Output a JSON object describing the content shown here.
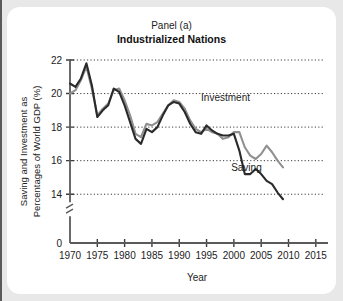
{
  "figure": {
    "panel_label": "Panel (a)",
    "title": "Industrialized Nations",
    "background_color": "#e8e8e8",
    "card_color": "#ffffff"
  },
  "chart_data": {
    "type": "line",
    "title": "Industrialized Nations",
    "subtitle": "Panel (a)",
    "xlabel": "Year",
    "ylabel": "Saving and Investment as Percentages of World GDP (%)",
    "ylabel_line1": "Saving and Investment as",
    "ylabel_line2": "Percentages of World GDP (%)",
    "xlim": [
      1970,
      2016.5
    ],
    "ylim": [
      13.0,
      22.0
    ],
    "yticks": [
      14,
      16,
      18,
      20,
      22
    ],
    "ytick_labels": [
      "14",
      "16",
      "18",
      "20",
      "22"
    ],
    "y_axis_origin_label": "0",
    "y_axis_break": true,
    "xticks": [
      1970,
      1975,
      1980,
      1985,
      1990,
      1995,
      2000,
      2005,
      2010,
      2015
    ],
    "xtick_labels": [
      "1970",
      "1975",
      "1980",
      "1985",
      "1990",
      "1995",
      "2000",
      "2005",
      "2010",
      "2015"
    ],
    "grid": "horizontal-dotted",
    "legend_position": "inline-annotation",
    "series": [
      {
        "name": "Investment",
        "color": "#909090",
        "annotation_x": 1994.0,
        "annotation_y": 19.55,
        "x": [
          1970,
          1971,
          1972,
          1973,
          1974,
          1975,
          1976,
          1977,
          1978,
          1979,
          1980,
          1981,
          1982,
          1983,
          1984,
          1985,
          1986,
          1987,
          1988,
          1989,
          1990,
          1991,
          1992,
          1993,
          1994,
          1995,
          1996,
          1997,
          1998,
          1999,
          2000,
          2001,
          2002,
          2003,
          2004,
          2005,
          2006,
          2007,
          2008,
          2009
        ],
        "values": [
          20.0,
          20.2,
          20.8,
          21.6,
          20.3,
          18.7,
          19.1,
          19.4,
          20.2,
          20.3,
          19.6,
          18.7,
          17.6,
          17.4,
          18.2,
          18.1,
          18.3,
          18.8,
          19.3,
          19.6,
          19.5,
          19.1,
          18.4,
          17.9,
          17.7,
          17.9,
          17.7,
          17.6,
          17.3,
          17.4,
          17.7,
          17.7,
          16.8,
          16.3,
          16.1,
          16.4,
          16.9,
          16.5,
          16.0,
          15.6
        ]
      },
      {
        "name": "Saving",
        "color": "#2a2a2a",
        "annotation_x": 1999.5,
        "annotation_y": 15.4,
        "x": [
          1970,
          1971,
          1972,
          1973,
          1974,
          1975,
          1976,
          1977,
          1978,
          1979,
          1980,
          1981,
          1982,
          1983,
          1984,
          1985,
          1986,
          1987,
          1988,
          1989,
          1990,
          1991,
          1992,
          1993,
          1994,
          1995,
          1996,
          1997,
          1998,
          1999,
          2000,
          2001,
          2002,
          2003,
          2004,
          2005,
          2006,
          2007,
          2008,
          2009
        ],
        "values": [
          20.6,
          20.4,
          20.9,
          21.8,
          20.5,
          18.6,
          19.0,
          19.3,
          20.3,
          20.1,
          19.3,
          18.3,
          17.3,
          17.0,
          17.9,
          17.7,
          18.0,
          18.7,
          19.3,
          19.5,
          19.4,
          18.9,
          18.2,
          17.7,
          17.6,
          18.1,
          17.8,
          17.6,
          17.5,
          17.5,
          17.6,
          16.6,
          15.2,
          15.2,
          15.5,
          15.2,
          14.8,
          14.6,
          14.1,
          13.7
        ]
      }
    ]
  }
}
